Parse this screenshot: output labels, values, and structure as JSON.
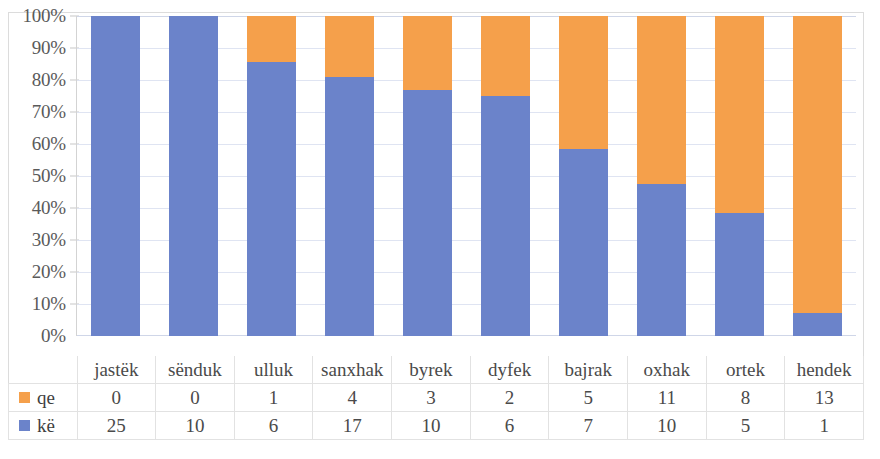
{
  "chart_data": {
    "type": "bar",
    "subtype": "stacked-100-percent",
    "title": "",
    "subtitle": "",
    "xlabel": "",
    "ylabel": "",
    "ylim": [
      0,
      100
    ],
    "y_tick_labels": [
      "100%",
      "90%",
      "80%",
      "70%",
      "60%",
      "50%",
      "40%",
      "30%",
      "20%",
      "10%",
      "0%"
    ],
    "y_tick_values": [
      100,
      90,
      80,
      70,
      60,
      50,
      40,
      30,
      20,
      10,
      0
    ],
    "grid": true,
    "legend_position": "bottom-left-table",
    "categories": [
      "jastëk",
      "sënduk",
      "ulluk",
      "sanxhak",
      "byrek",
      "dyfek",
      "bajrak",
      "oxhak",
      "ortek",
      "hendek"
    ],
    "series": [
      {
        "name": "qe",
        "color": "#F5A04B",
        "values": [
          0,
          0,
          1,
          4,
          3,
          2,
          5,
          11,
          8,
          13
        ],
        "percents": [
          0.0,
          0.0,
          14.3,
          19.0,
          23.1,
          25.0,
          41.7,
          52.4,
          61.5,
          92.9
        ]
      },
      {
        "name": "kë",
        "color": "#6B83CA",
        "values": [
          25,
          10,
          6,
          17,
          10,
          6,
          7,
          10,
          5,
          1
        ],
        "percents": [
          100.0,
          100.0,
          85.7,
          81.0,
          76.9,
          75.0,
          58.3,
          47.6,
          38.5,
          7.1
        ]
      }
    ],
    "totals": [
      25,
      10,
      7,
      21,
      13,
      8,
      12,
      21,
      13,
      14
    ]
  },
  "legend": {
    "qe_label": "qe",
    "ke_label": "kë",
    "qe_swatch": "#F5A04B",
    "ke_swatch": "#6B83CA"
  },
  "colors": {
    "blue": "#6B83CA",
    "orange": "#F5A04B",
    "gridline": "#dfe4f2",
    "border": "#dcdcdc",
    "text": "#4a4a4a"
  }
}
